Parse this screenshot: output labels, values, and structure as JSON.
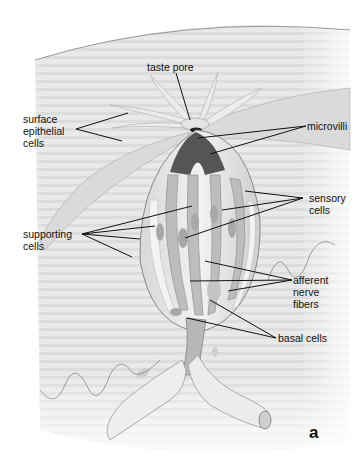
{
  "figure": {
    "panel_letter": "a",
    "background_color": "#ffffff",
    "tissue_color": "#e6e6e6",
    "line_color": "#111111"
  },
  "labels": {
    "taste_pore": "taste pore",
    "surface_epithelial_cells": "surface\nepithelial\ncells",
    "microvilli": "microvilli",
    "sensory_cells": "sensory\ncells",
    "supporting_cells": "supporting\ncells",
    "afferent_nerve_fibers": "afferent\nnerve\nfibers",
    "basal_cells": "basal cells"
  }
}
